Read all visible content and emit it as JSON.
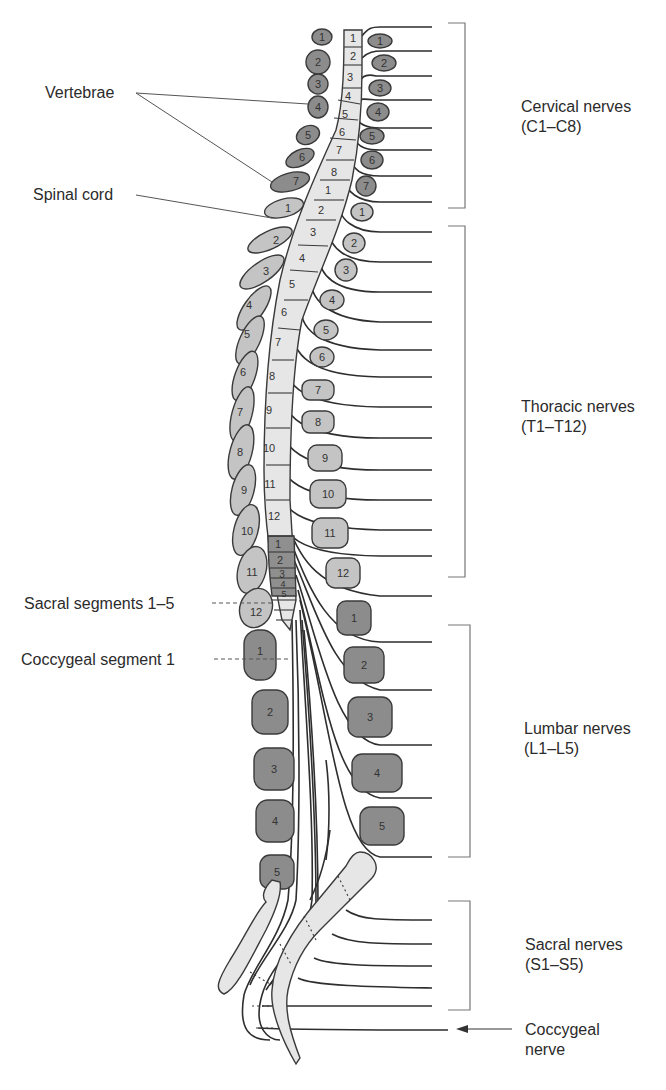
{
  "colors": {
    "background": "#ffffff",
    "outline": "#3a3a3a",
    "vertebra_dark": "#8c8c8c",
    "vertebra_light": "#c4c4c4",
    "cord_light": "#e6e6e6",
    "cord_sacral": "#8f8f8f",
    "leader_line": "#555555",
    "text": "#2b2b2b"
  },
  "labels": {
    "vertebrae": "Vertebrae",
    "spinal_cord": "Spinal cord",
    "sacral_segments": "Sacral segments 1–5",
    "coccygeal_segment": "Coccygeal segment 1"
  },
  "nerve_groups": [
    {
      "name": "Cervical nerves",
      "range": "(C1–C8)"
    },
    {
      "name": "Thoracic nerves",
      "range": "(T1–T12)"
    },
    {
      "name": "Lumbar nerves",
      "range": "(L1–L5)"
    },
    {
      "name": "Sacral nerves",
      "range": "(S1–S5)"
    }
  ],
  "coccygeal_nerve": {
    "line1": "Coccygeal",
    "line2": "nerve"
  },
  "cord_segments": {
    "cervical": [
      "1",
      "2",
      "3",
      "4",
      "5",
      "6",
      "7",
      "8"
    ],
    "thoracic": [
      "1",
      "2",
      "3",
      "4",
      "5",
      "6",
      "7",
      "8",
      "9",
      "10",
      "11",
      "12"
    ],
    "lumbar": [
      "1",
      "2",
      "3",
      "4",
      "5"
    ]
  },
  "vertebrae_left": {
    "cervical": [
      "1",
      "2",
      "3",
      "4",
      "5",
      "6",
      "7"
    ],
    "thoracic": [
      "1",
      "2",
      "3",
      "4",
      "5",
      "6",
      "7",
      "8",
      "9",
      "10",
      "11",
      "12"
    ],
    "lumbar": [
      "1",
      "2",
      "3",
      "4",
      "5"
    ]
  },
  "vertebrae_right": {
    "cervical": [
      "1",
      "2",
      "3",
      "4",
      "5",
      "6",
      "7"
    ],
    "thoracic": [
      "1",
      "2",
      "3",
      "4",
      "5",
      "6",
      "7",
      "8",
      "9",
      "10",
      "11",
      "12"
    ],
    "lumbar": [
      "1",
      "2",
      "3",
      "4",
      "5"
    ]
  }
}
